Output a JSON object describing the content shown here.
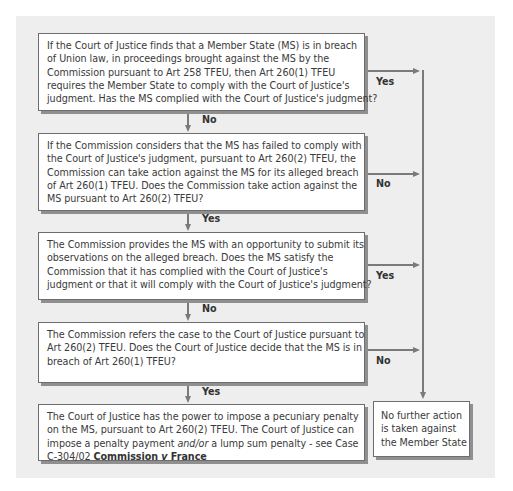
{
  "diagram": {
    "boxes": [
      {
        "id": "complied-check",
        "lines": [
          "If the Court of Justice finds that a Member State (MS) is in breach",
          "of Union law, in proceedings brought against the MS by the",
          "Commission pursuant to Art 258 TFEU, then Art 260(1) TFEU",
          "requires the Member State to comply with the Court of Justice's",
          "judgment. Has the MS complied with the Court of Justice's judgment?"
        ]
      },
      {
        "id": "commission-action",
        "lines": [
          "If the Commission considers that the MS has failed to comply with",
          "the Court of Justice's judgment, pursuant to Art 260(2) TFEU, the",
          "Commission can take action against the MS for its alleged breach",
          "of Art 260(1) TFEU. Does the Commission take action against the",
          "MS pursuant to Art 260(2) TFEU?"
        ]
      },
      {
        "id": "observations",
        "lines": [
          "The Commission provides the MS with an opportunity to submit its",
          "observations on the alleged breach. Does the MS satisfy the",
          "Commission that it has complied with the Court of Justice's",
          "judgment or that it will comply with the Court of Justice's judgment?"
        ]
      },
      {
        "id": "referral",
        "lines": [
          "The Commission refers the case to the Court of Justice pursuant to",
          "Art 260(2) TFEU. Does the Court of Justice decide that the MS is in",
          "breach of Art 260(1) TFEU?"
        ]
      },
      {
        "id": "penalty",
        "lines": [
          "The Court of Justice has the power to impose a pecuniary penalty",
          "on the MS, pursuant to Art 260(2) TFEU. The Court of Justice can",
          "impose a penalty payment ",
          "C-304/02 "
        ],
        "italic": "and/or",
        "line3_tail": " a lump sum penalty - see Case",
        "case_name": "Commission v France",
        "case_part1": "Commission ",
        "case_v": "v",
        "case_part2": " France"
      },
      {
        "id": "no-further-action",
        "lines": [
          "No further action",
          "is taken against",
          "the Member State"
        ]
      }
    ],
    "labels": {
      "b1_down": "No",
      "b1_right": "Yes",
      "b2_down": "Yes",
      "b2_right": "No",
      "b3_down": "No",
      "b3_right": "Yes",
      "b4_down": "Yes",
      "b4_right": "No"
    },
    "colors": {
      "panel": "#eeeeee",
      "box": "#ffffff",
      "line": "#7a7a7a",
      "text": "#3a3a3a"
    }
  }
}
